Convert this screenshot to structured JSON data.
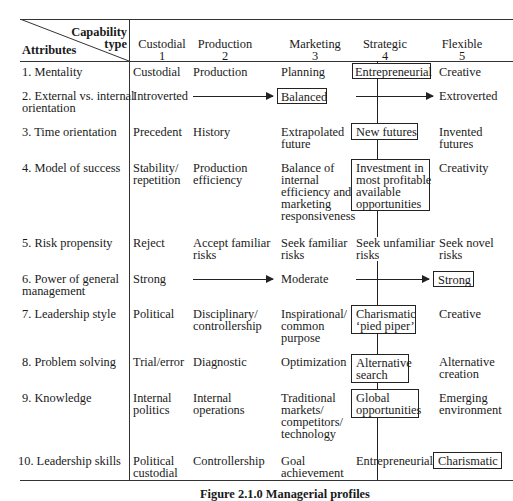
{
  "header": {
    "corner_top": "Capability",
    "corner_top2": "type",
    "corner_bottom": "Attributes",
    "columns": [
      {
        "name": "Custodial",
        "num": "1"
      },
      {
        "name": "Production",
        "num": "2"
      },
      {
        "name": "Marketing",
        "num": "3"
      },
      {
        "name": "Strategic",
        "num": "4"
      },
      {
        "name": "Flexible",
        "num": "5"
      }
    ]
  },
  "rows": [
    {
      "label": "1.  Mentality",
      "cells": [
        "Custodial",
        "Production",
        "Planning",
        "Entrepreneurial",
        "Creative"
      ]
    },
    {
      "label": "2.  External vs. internal\n     orientation",
      "cells": [
        "Introverted",
        "",
        "Balanced",
        "",
        "Extroverted"
      ]
    },
    {
      "label": "3.  Time orientation",
      "cells": [
        "Precedent",
        "History",
        "Extrapolated\nfuture",
        "New futures",
        "Invented\nfutures"
      ]
    },
    {
      "label": "4.  Model of success",
      "cells": [
        "Stability/\nrepetition",
        "Production\nefficiency",
        "Balance of\ninternal\nefficiency and\nmarketing\nresponsiveness",
        "Investment in\nmost profitable\navailable\nopportunities",
        "Creativity"
      ]
    },
    {
      "label": "5.  Risk propensity",
      "cells": [
        "Reject",
        "Accept familiar\nrisks",
        "Seek familiar\nrisks",
        "Seek unfamiliar\nrisks",
        "Seek novel\nrisks"
      ]
    },
    {
      "label": "6.  Power of general\n     management",
      "cells": [
        "Strong",
        "",
        "Moderate",
        "",
        "Strong"
      ]
    },
    {
      "label": "7.  Leadership style",
      "cells": [
        "Political",
        "Disciplinary/\ncontrollership",
        "Inspirational/\ncommon\npurpose",
        "Charismatic\n‘pied piper’",
        "Creative"
      ]
    },
    {
      "label": "8.  Problem solving",
      "cells": [
        "Trial/error",
        "Diagnostic",
        "Optimization",
        "Alternative\nsearch",
        "Alternative\ncreation"
      ]
    },
    {
      "label": "9.  Knowledge",
      "cells": [
        "Internal\npolitics",
        "Internal\noperations",
        "Traditional\nmarkets/\ncompetitors/\ntechnology",
        "Global\nopportunities",
        "Emerging\nenvironment"
      ]
    },
    {
      "label": "10.  Leadership skills",
      "cells": [
        "Political\ncustodial",
        "Controllership",
        "Goal\nachievement",
        "Entrepreneurial",
        "Charismatic"
      ]
    }
  ],
  "caption": "Figure 2.1.0  Managerial profiles"
}
